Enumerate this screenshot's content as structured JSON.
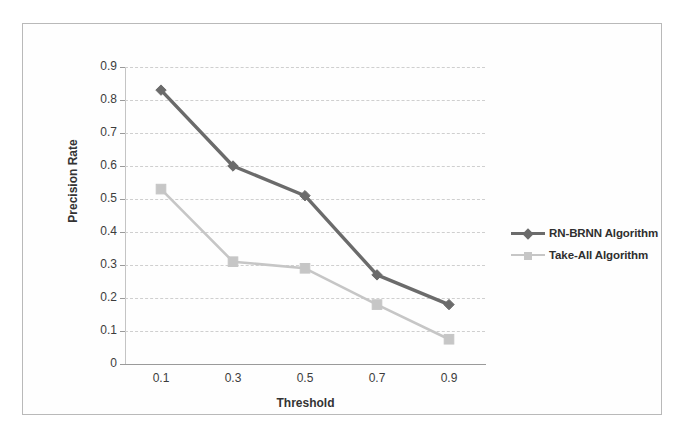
{
  "chart_data": {
    "type": "line",
    "title": "",
    "xlabel": "Threshold",
    "ylabel": "Precision Rate",
    "categories": [
      "0.1",
      "0.3",
      "0.5",
      "0.7",
      "0.9"
    ],
    "x": [
      0.1,
      0.3,
      0.5,
      0.7,
      0.9
    ],
    "ylim": [
      0,
      0.9
    ],
    "ytick_labels": [
      "0.9",
      "0.8",
      "0.7",
      "0.6",
      "0.5",
      "0.4",
      "0.3",
      "0.2",
      "0.1",
      "0"
    ],
    "ytick_values": [
      0.9,
      0.8,
      0.7,
      0.6,
      0.5,
      0.4,
      0.3,
      0.2,
      0.1,
      0
    ],
    "grid": "horizontal-dashed",
    "legend_position": "right-middle",
    "series": [
      {
        "name": "RN-BRNN Algorithm",
        "values": [
          0.83,
          0.6,
          0.51,
          0.27,
          0.18
        ],
        "color": "#6b6b6b",
        "marker": "diamond"
      },
      {
        "name": "Take-All Algorithm",
        "values": [
          0.53,
          0.31,
          0.29,
          0.18,
          0.075
        ],
        "color": "#c6c6c6",
        "marker": "square"
      }
    ]
  },
  "legend": {
    "items": [
      {
        "label": "RN-BRNN Algorithm"
      },
      {
        "label": "Take-All Algorithm"
      }
    ]
  },
  "colors": {
    "series_1": "#6b6b6b",
    "series_2": "#c6c6c6",
    "grid": "#cfcfcf",
    "axis": "#9a9a9a",
    "frame": "#b9b9b9",
    "text": "#3a3a3a",
    "background": "#ffffff"
  }
}
